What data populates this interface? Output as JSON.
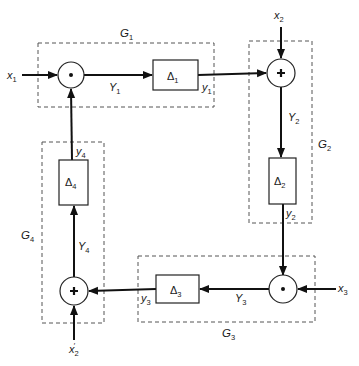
{
  "diagram": {
    "type": "block-diagram",
    "groups": [
      {
        "id": "G1",
        "label": "G",
        "sub": "1"
      },
      {
        "id": "G2",
        "label": "G",
        "sub": "2"
      },
      {
        "id": "G3",
        "label": "G",
        "sub": "3"
      },
      {
        "id": "G4",
        "label": "G",
        "sub": "4"
      }
    ],
    "blocks": [
      {
        "id": "D1",
        "label": "Δ",
        "sub": "1"
      },
      {
        "id": "D2",
        "label": "Δ",
        "sub": "2"
      },
      {
        "id": "D3",
        "label": "Δ",
        "sub": "3"
      },
      {
        "id": "D4",
        "label": "Δ",
        "sub": "4"
      }
    ],
    "nodes": [
      {
        "id": "n1",
        "type": "multiply",
        "symbol": "•",
        "group": "G1"
      },
      {
        "id": "n2",
        "type": "sum",
        "symbol": "+",
        "group": "G2"
      },
      {
        "id": "n3",
        "type": "multiply",
        "symbol": "•",
        "group": "G3"
      },
      {
        "id": "n4",
        "type": "sum",
        "symbol": "+",
        "group": "G4"
      }
    ],
    "inputs": [
      {
        "id": "x1",
        "label": "x",
        "sub": "1",
        "prime": ""
      },
      {
        "id": "x2",
        "label": "x",
        "sub": "2",
        "prime": ""
      },
      {
        "id": "x3",
        "label": "x",
        "sub": "3",
        "prime": ""
      },
      {
        "id": "x2p",
        "label": "x",
        "sub": "2",
        "prime": "′"
      }
    ],
    "signals": [
      {
        "id": "Y1",
        "label": "Y",
        "sub": "1"
      },
      {
        "id": "y1",
        "label": "y",
        "sub": "1"
      },
      {
        "id": "Y2",
        "label": "Y",
        "sub": "2"
      },
      {
        "id": "y2",
        "label": "y",
        "sub": "2"
      },
      {
        "id": "Y3",
        "label": "Y",
        "sub": "3"
      },
      {
        "id": "y3",
        "label": "y",
        "sub": "3"
      },
      {
        "id": "Y4",
        "label": "Y",
        "sub": "4"
      },
      {
        "id": "y4",
        "label": "y",
        "sub": "4"
      }
    ],
    "connections": [
      [
        "x1",
        "n1"
      ],
      [
        "n1",
        "D1",
        "Y1"
      ],
      [
        "D1",
        "n2",
        "y1"
      ],
      [
        "x2",
        "n2"
      ],
      [
        "n2",
        "D2",
        "Y2"
      ],
      [
        "D2",
        "n3",
        "y2"
      ],
      [
        "x3",
        "n3"
      ],
      [
        "n3",
        "D3",
        "Y3"
      ],
      [
        "D3",
        "n4",
        "y3"
      ],
      [
        "x2p",
        "n4"
      ],
      [
        "n4",
        "D4",
        "Y4"
      ],
      [
        "D4",
        "n1",
        "y4"
      ]
    ]
  }
}
